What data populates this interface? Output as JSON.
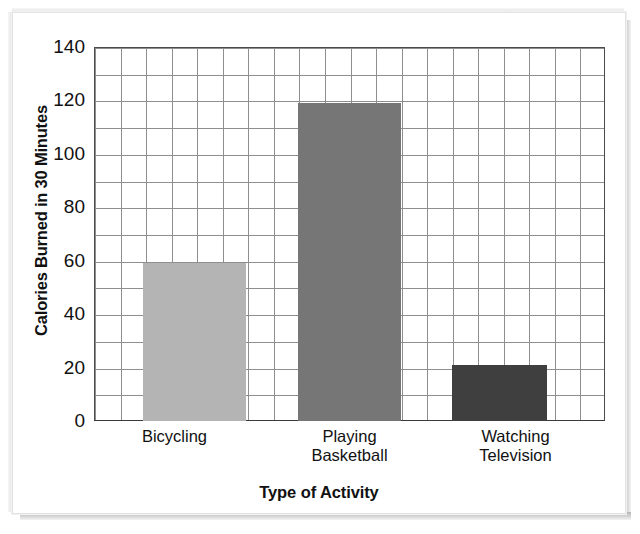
{
  "chart_data": {
    "type": "bar",
    "title": "",
    "xlabel": "Type of Activity",
    "ylabel": "Calories Burned in 30 Minutes",
    "categories": [
      "Bicycling",
      "Playing\nBasketball",
      "Watching\nTelevision"
    ],
    "values": [
      59,
      119,
      21
    ],
    "ylim": [
      0,
      140
    ],
    "ytick_labels": [
      "0",
      "20",
      "40",
      "60",
      "80",
      "100",
      "120",
      "140"
    ],
    "ytick_values": [
      0,
      20,
      40,
      60,
      80,
      100,
      120,
      140
    ],
    "grid": true,
    "grid_minor_step": 10,
    "legend": "none",
    "bar_colors": [
      "#b4b4b4",
      "#767676",
      "#3f3f3f"
    ],
    "series": [
      {
        "name": "Calories Burned in 30 Minutes",
        "points": [
          {
            "label": "Bicycling",
            "value": 59
          },
          {
            "label": "Playing Basketball",
            "value": 119
          },
          {
            "label": "Watching Television",
            "value": 21
          }
        ]
      }
    ]
  },
  "axis": {
    "y_title": "Calories Burned in 30 Minutes",
    "x_title": "Type of Activity"
  },
  "ticks": {
    "t0": "0",
    "t20": "20",
    "t40": "40",
    "t60": "60",
    "t80": "80",
    "t100": "100",
    "t120": "120",
    "t140": "140"
  },
  "categories": {
    "c0": "Bicycling",
    "c1": "Playing\nBasketball",
    "c2": "Watching\nTelevision"
  }
}
